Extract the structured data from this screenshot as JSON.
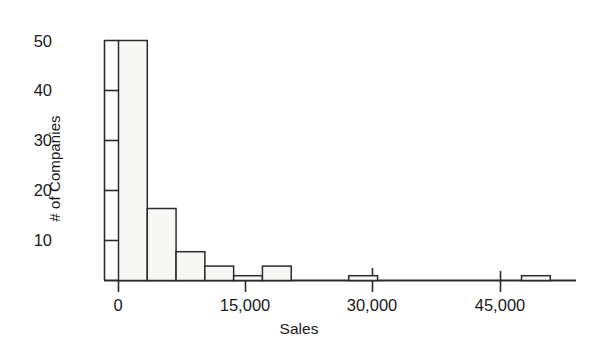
{
  "chart_data": {
    "type": "bar",
    "title": "",
    "subtitle": "",
    "xlabel": "Sales",
    "ylabel": "# of Companies",
    "grid": false,
    "legend": null,
    "xlim": [
      -1700,
      54000
    ],
    "ylim": [
      0,
      52
    ],
    "bin_width": 3400,
    "x_ticks": [
      {
        "value": 0,
        "label": "0"
      },
      {
        "value": 15000,
        "label": "15,000"
      },
      {
        "value": 30000,
        "label": "30,000"
      },
      {
        "value": 45000,
        "label": "45,000"
      }
    ],
    "y_ticks": [
      {
        "value": 10,
        "label": "10"
      },
      {
        "value": 20,
        "label": "20"
      },
      {
        "value": 30,
        "label": "30"
      },
      {
        "value": 40,
        "label": "40"
      },
      {
        "value": 50,
        "label": "50"
      }
    ],
    "bins": [
      {
        "x0": 0,
        "x1": 3400,
        "value": 50
      },
      {
        "x0": 3400,
        "x1": 6800,
        "value": 15
      },
      {
        "x0": 6800,
        "x1": 10200,
        "value": 6
      },
      {
        "x0": 10200,
        "x1": 13600,
        "value": 3
      },
      {
        "x0": 13600,
        "x1": 17000,
        "value": 1
      },
      {
        "x0": 17000,
        "x1": 20400,
        "value": 3
      },
      {
        "x0": 20400,
        "x1": 23800,
        "value": 0
      },
      {
        "x0": 23800,
        "x1": 27200,
        "value": 0
      },
      {
        "x0": 27200,
        "x1": 30600,
        "value": 1
      },
      {
        "x0": 30600,
        "x1": 34000,
        "value": 0
      },
      {
        "x0": 34000,
        "x1": 37400,
        "value": 0
      },
      {
        "x0": 37400,
        "x1": 40800,
        "value": 0
      },
      {
        "x0": 40800,
        "x1": 44200,
        "value": 0
      },
      {
        "x0": 44200,
        "x1": 47600,
        "value": 0
      },
      {
        "x0": 47600,
        "x1": 51000,
        "value": 1
      }
    ],
    "categories": [
      "0-3,400",
      "3,400-6,800",
      "6,800-10,200",
      "10,200-13,600",
      "13,600-17,000",
      "17,000-20,400",
      "20,400-23,800",
      "23,800-27,200",
      "27,200-30,600",
      "30,600-34,000",
      "34,000-37,400",
      "37,400-40,800",
      "40,800-44,200",
      "44,200-47,600",
      "47,600-51,000"
    ],
    "values": [
      50,
      15,
      6,
      3,
      1,
      3,
      0,
      0,
      1,
      0,
      0,
      0,
      0,
      0,
      1
    ],
    "colors": {
      "bar_fill": "#f7f7f5",
      "bar_stroke": "#2b2b2b",
      "axis": "#2b2b2b",
      "text": "#1a1a1a",
      "background": "#ffffff"
    }
  }
}
